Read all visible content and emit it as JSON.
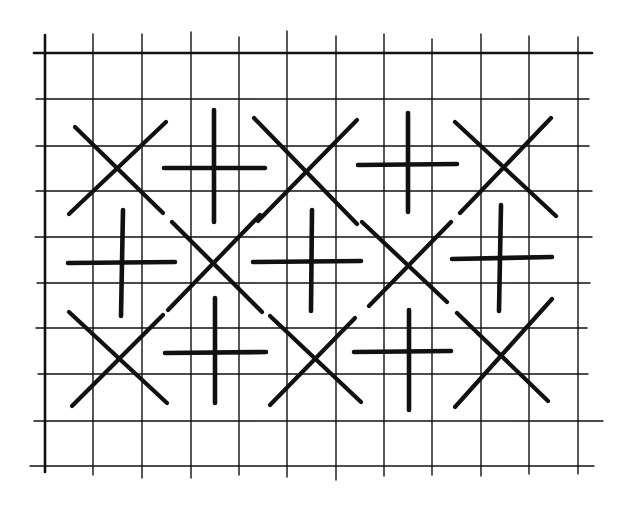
{
  "diagram": {
    "type": "stitch-pattern",
    "colors": {
      "background": "#ffffff",
      "ink": "#111111"
    },
    "grid": {
      "vertical_lines": [
        {
          "x": 45,
          "y1": 35,
          "y2": 472,
          "w": 2.6
        },
        {
          "x": 93,
          "y1": 34,
          "y2": 475,
          "w": 1.4
        },
        {
          "x": 142,
          "y1": 34,
          "y2": 478,
          "w": 1.4
        },
        {
          "x": 191,
          "y1": 32,
          "y2": 478,
          "w": 1.4
        },
        {
          "x": 239,
          "y1": 37,
          "y2": 475,
          "w": 1.4
        },
        {
          "x": 287,
          "y1": 31,
          "y2": 477,
          "w": 1.4
        },
        {
          "x": 336,
          "y1": 36,
          "y2": 480,
          "w": 1.4
        },
        {
          "x": 384,
          "y1": 34,
          "y2": 476,
          "w": 1.4
        },
        {
          "x": 432,
          "y1": 39,
          "y2": 475,
          "w": 1.4
        },
        {
          "x": 481,
          "y1": 34,
          "y2": 476,
          "w": 1.4
        },
        {
          "x": 529,
          "y1": 36,
          "y2": 474,
          "w": 1.4
        },
        {
          "x": 578,
          "y1": 37,
          "y2": 474,
          "w": 1.4
        }
      ],
      "horizontal_lines": [
        {
          "y": 53,
          "x1": 34,
          "x2": 592,
          "w": 2.6
        },
        {
          "y": 99,
          "x1": 36,
          "x2": 589,
          "w": 1.4
        },
        {
          "y": 146,
          "x1": 36,
          "x2": 589,
          "w": 1.4
        },
        {
          "y": 191,
          "x1": 36,
          "x2": 592,
          "w": 1.4
        },
        {
          "y": 237,
          "x1": 35,
          "x2": 592,
          "w": 1.4
        },
        {
          "y": 283,
          "x1": 37,
          "x2": 590,
          "w": 1.4
        },
        {
          "y": 328,
          "x1": 36,
          "x2": 587,
          "w": 1.4
        },
        {
          "y": 374,
          "x1": 38,
          "x2": 588,
          "w": 1.4
        },
        {
          "y": 421,
          "x1": 34,
          "x2": 603,
          "w": 1.4
        },
        {
          "y": 466,
          "x1": 30,
          "x2": 594,
          "w": 1.4
        }
      ]
    },
    "stitches": [
      {
        "kind": "x",
        "row": 1,
        "col": 1,
        "a": [
          75,
          127,
          163,
          213
        ],
        "b": [
          69,
          214,
          166,
          122
        ]
      },
      {
        "kind": "plus",
        "row": 1,
        "col": 2,
        "h": [
          164,
          168,
          265,
          168
        ],
        "v": [
          214,
          110,
          214,
          222
        ]
      },
      {
        "kind": "x",
        "row": 1,
        "col": 3,
        "a": [
          254,
          118,
          357,
          224
        ],
        "b": [
          258,
          221,
          357,
          120
        ]
      },
      {
        "kind": "plus",
        "row": 1,
        "col": 4,
        "h": [
          358,
          165,
          457,
          164
        ],
        "v": [
          408,
          113,
          408,
          212
        ]
      },
      {
        "kind": "x",
        "row": 1,
        "col": 5,
        "a": [
          455,
          122,
          556,
          216
        ],
        "b": [
          460,
          213,
          551,
          118
        ]
      },
      {
        "kind": "plus",
        "row": 2,
        "col": 1,
        "h": [
          68,
          263,
          175,
          262
        ],
        "v": [
          123,
          210,
          121,
          316
        ]
      },
      {
        "kind": "x",
        "row": 2,
        "col": 2,
        "a": [
          172,
          222,
          262,
          312
        ],
        "b": [
          168,
          310,
          260,
          215
        ]
      },
      {
        "kind": "plus",
        "row": 2,
        "col": 3,
        "h": [
          253,
          262,
          361,
          261
        ],
        "v": [
          312,
          210,
          311,
          311
        ]
      },
      {
        "kind": "x",
        "row": 2,
        "col": 4,
        "a": [
          362,
          222,
          447,
          302
        ],
        "b": [
          369,
          306,
          451,
          222
        ]
      },
      {
        "kind": "plus",
        "row": 2,
        "col": 5,
        "h": [
          452,
          259,
          552,
          257
        ],
        "v": [
          501,
          205,
          499,
          311
        ]
      },
      {
        "kind": "x",
        "row": 3,
        "col": 1,
        "a": [
          69,
          312,
          167,
          403
        ],
        "b": [
          72,
          406,
          163,
          315
        ]
      },
      {
        "kind": "plus",
        "row": 3,
        "col": 2,
        "h": [
          165,
          353,
          266,
          352
        ],
        "v": [
          215,
          298,
          215,
          403
        ]
      },
      {
        "kind": "x",
        "row": 3,
        "col": 3,
        "a": [
          270,
          316,
          361,
          402
        ],
        "b": [
          270,
          405,
          355,
          318
        ]
      },
      {
        "kind": "plus",
        "row": 3,
        "col": 4,
        "h": [
          354,
          352,
          451,
          351
        ],
        "v": [
          409,
          310,
          409,
          410
        ]
      },
      {
        "kind": "x",
        "row": 3,
        "col": 5,
        "a": [
          457,
          313,
          548,
          401
        ],
        "b": [
          455,
          407,
          552,
          299
        ]
      }
    ]
  }
}
